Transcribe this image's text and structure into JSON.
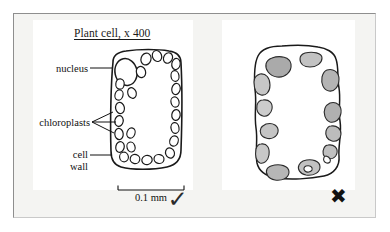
{
  "figure": {
    "kind": "biology-textbook-comparison-figure"
  },
  "good_panel": {
    "title": "Plant cell, x 400",
    "labels": {
      "nucleus": "nucleus",
      "chloroplasts": "chloroplasts",
      "cell_wall": "cell\nwall",
      "cell_wall_line1": "cell",
      "cell_wall_line2": "wall"
    },
    "scale_bar": {
      "caption": "0.1 mm",
      "length_px": 66
    },
    "verdict_mark": "✓",
    "verdict_name": "tick"
  },
  "bad_panel": {
    "title": "",
    "verdict_mark": "✖",
    "verdict_name": "cross"
  },
  "colors": {
    "page_background": "#ffffff",
    "frame_background": "#f4f4f2",
    "frame_border_dark": "#8e8e8e",
    "frame_border_light": "#c9c9c9",
    "panel_background": "#ffffff",
    "ink": "#111111",
    "organelle_fill_light": "#cfcfcf",
    "organelle_fill_mid": "#b8b8b8",
    "organelle_fill_dark": "#a6a6a6"
  }
}
